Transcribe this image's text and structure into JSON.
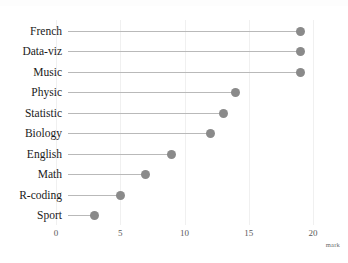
{
  "chart_data": {
    "type": "bar",
    "subtype": "lollipop-horizontal",
    "title": "",
    "subtitle": "",
    "xlabel": "mark",
    "ylabel": "",
    "categories": [
      "French",
      "Data-viz",
      "Music",
      "Physic",
      "Statistic",
      "Biology",
      "English",
      "Math",
      "R-coding",
      "Sport"
    ],
    "values": [
      19,
      19,
      19,
      14,
      13,
      12,
      9,
      7,
      5,
      3
    ],
    "xticks": [
      0,
      5,
      10,
      15,
      20
    ],
    "xtick_labels": [
      "0",
      "5",
      "10",
      "15",
      "20"
    ],
    "xlim": [
      0,
      20.5
    ],
    "grid": "vertical-light",
    "legend": "none",
    "sorted": "descending",
    "colors": {
      "dot": "#8a8a8a",
      "stem": "#b9b9b9",
      "grid": "#f0f0f0",
      "label": "#1a1a1a",
      "tick": "#5a5a5a",
      "background": "#ffffff"
    }
  },
  "axis": {
    "x_title": "mark"
  }
}
